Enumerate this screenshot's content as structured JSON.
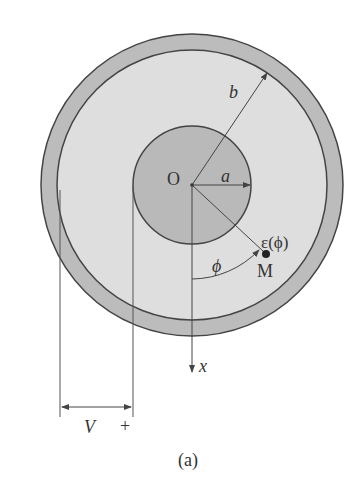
{
  "diagram": {
    "caption": "(a)",
    "labels": {
      "center": "O",
      "inner_radius": "a",
      "outer_radius": "b",
      "permittivity": "ε(ϕ)",
      "angle": "ϕ",
      "point": "M",
      "axis": "x",
      "voltage": "V",
      "polarity": "+"
    },
    "colors": {
      "outer_conductor": "#bcbcbc",
      "dielectric": "#dedede",
      "inner_conductor": "#b9b9b9",
      "stroke": "#444444"
    }
  }
}
